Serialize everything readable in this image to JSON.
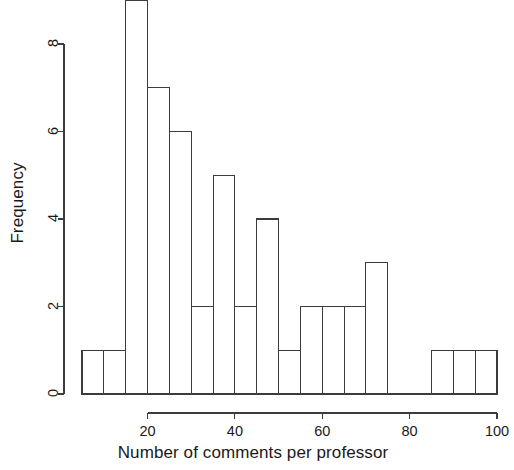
{
  "chart_data": {
    "type": "bar",
    "subtype": "histogram",
    "title": "",
    "xlabel": "Number of comments per professor",
    "ylabel": "Frequency",
    "xlim": [
      5,
      100
    ],
    "ylim": [
      0,
      9
    ],
    "xticks": [
      20,
      40,
      60,
      80,
      100
    ],
    "yticks": [
      0,
      2,
      4,
      6,
      8
    ],
    "grid": false,
    "legend": null,
    "bin_width": 5,
    "bin_edges": [
      5,
      10,
      15,
      20,
      25,
      30,
      35,
      40,
      45,
      50,
      55,
      60,
      65,
      70,
      75,
      80,
      85,
      90,
      95,
      100
    ],
    "categories": [
      "5-10",
      "10-15",
      "15-20",
      "20-25",
      "25-30",
      "30-35",
      "35-40",
      "40-45",
      "45-50",
      "50-55",
      "55-60",
      "60-65",
      "65-70",
      "70-75",
      "75-80",
      "80-85",
      "85-90",
      "90-95",
      "95-100"
    ],
    "values": [
      1,
      1,
      9,
      7,
      6,
      2,
      5,
      2,
      4,
      1,
      2,
      2,
      2,
      3,
      0,
      0,
      1,
      1,
      1
    ],
    "bar_fill": "#ffffff",
    "bar_stroke": "#3c3c3c",
    "axis_color": "#3c3c3c"
  },
  "axes": {
    "y_title": "Frequency",
    "x_title": "Number of comments per professor",
    "y_tick_labels": [
      "0",
      "2",
      "4",
      "6",
      "8"
    ],
    "x_tick_labels": [
      "20",
      "40",
      "60",
      "80",
      "100"
    ]
  }
}
